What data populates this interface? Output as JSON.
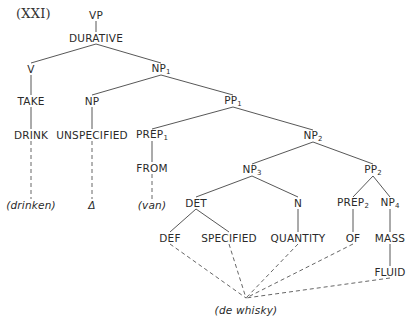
{
  "title": "(XXI)",
  "nodes": {
    "vp": {
      "text": "VP",
      "x": 96,
      "y": 15
    },
    "durative": {
      "text": "DURATIVE",
      "x": 96,
      "y": 38
    },
    "v": {
      "text": "V",
      "x": 31,
      "y": 69
    },
    "np1": {
      "text": "NP",
      "sub": "1",
      "x": 161,
      "y": 69
    },
    "take": {
      "text": "TAKE",
      "x": 31,
      "y": 101
    },
    "np": {
      "text": "NP",
      "x": 92,
      "y": 101
    },
    "pp1": {
      "text": "PP",
      "sub": "1",
      "x": 233,
      "y": 101
    },
    "drink": {
      "text": "DRINK",
      "x": 31,
      "y": 135
    },
    "unspecified": {
      "text": "UNSPECIFIED",
      "x": 92,
      "y": 135
    },
    "prep1": {
      "text": "PREP",
      "sub": "1",
      "x": 152,
      "y": 135
    },
    "np2": {
      "text": "NP",
      "sub": "2",
      "x": 313,
      "y": 136
    },
    "from": {
      "text": "FROM",
      "x": 152,
      "y": 168
    },
    "np3": {
      "text": "NP",
      "sub": "3",
      "x": 252,
      "y": 170
    },
    "pp2": {
      "text": "PP",
      "sub": "2",
      "x": 373,
      "y": 170
    },
    "drinken": {
      "text": "(drinken)",
      "x": 31,
      "y": 205,
      "gloss": true
    },
    "delta": {
      "text": "Δ",
      "x": 92,
      "y": 205,
      "gloss": true
    },
    "van": {
      "text": "(van)",
      "x": 152,
      "y": 205,
      "gloss": true
    },
    "det": {
      "text": "DET",
      "x": 196,
      "y": 203
    },
    "n": {
      "text": "N",
      "x": 298,
      "y": 203
    },
    "prep2": {
      "text": "PREP",
      "sub": "2",
      "x": 353,
      "y": 203
    },
    "np4": {
      "text": "NP",
      "sub": "4",
      "x": 390,
      "y": 203
    },
    "def": {
      "text": "DEF",
      "x": 170,
      "y": 238
    },
    "specified": {
      "text": "SPECIFIED",
      "x": 229,
      "y": 238
    },
    "quantity": {
      "text": "QUANTITY",
      "x": 298,
      "y": 238
    },
    "of": {
      "text": "OF",
      "x": 353,
      "y": 238
    },
    "mass": {
      "text": "MASS",
      "x": 390,
      "y": 238
    },
    "fluid": {
      "text": "FLUID",
      "x": 390,
      "y": 272
    },
    "de_whisky": {
      "text": "(de whisky)",
      "x": 246,
      "y": 310,
      "gloss": true
    }
  },
  "edges": [
    {
      "from": "vp",
      "to": "durative",
      "style": "solid"
    },
    {
      "from": "durative",
      "to": "v",
      "style": "solid"
    },
    {
      "from": "durative",
      "to": "np1",
      "style": "solid"
    },
    {
      "from": "v",
      "to": "take",
      "style": "solid"
    },
    {
      "from": "take",
      "to": "drink",
      "style": "solid"
    },
    {
      "from": "np1",
      "to": "np",
      "style": "solid"
    },
    {
      "from": "np1",
      "to": "pp1",
      "style": "solid"
    },
    {
      "from": "np",
      "to": "unspecified",
      "style": "solid"
    },
    {
      "from": "pp1",
      "to": "prep1",
      "style": "solid"
    },
    {
      "from": "pp1",
      "to": "np2",
      "style": "solid"
    },
    {
      "from": "prep1",
      "to": "from",
      "style": "solid"
    },
    {
      "from": "np2",
      "to": "np3",
      "style": "solid"
    },
    {
      "from": "np2",
      "to": "pp2",
      "style": "solid"
    },
    {
      "from": "np3",
      "to": "det",
      "style": "solid"
    },
    {
      "from": "np3",
      "to": "n",
      "style": "solid"
    },
    {
      "from": "det",
      "to": "def",
      "style": "solid"
    },
    {
      "from": "det",
      "to": "specified",
      "style": "solid"
    },
    {
      "from": "n",
      "to": "quantity",
      "style": "solid"
    },
    {
      "from": "pp2",
      "to": "prep2",
      "style": "solid"
    },
    {
      "from": "pp2",
      "to": "np4",
      "style": "solid"
    },
    {
      "from": "prep2",
      "to": "of",
      "style": "solid"
    },
    {
      "from": "np4",
      "to": "mass",
      "style": "solid"
    },
    {
      "from": "mass",
      "to": "fluid",
      "style": "solid"
    },
    {
      "from": "drink",
      "to": "drinken",
      "style": "dashed"
    },
    {
      "from": "unspecified",
      "to": "delta",
      "style": "dashed"
    },
    {
      "from": "from",
      "to": "van",
      "style": "dashed"
    },
    {
      "from": "def",
      "to": "whisky_pt",
      "style": "dashed"
    },
    {
      "from": "specified",
      "to": "whisky_pt",
      "style": "dashed"
    },
    {
      "from": "quantity",
      "to": "whisky_pt",
      "style": "dashed"
    },
    {
      "from": "of",
      "to": "whisky_pt",
      "style": "dashed"
    },
    {
      "from": "fluid",
      "to": "whisky_pt",
      "style": "dashed"
    }
  ],
  "points": {
    "whisky_pt": {
      "x": 246,
      "y": 298
    }
  }
}
